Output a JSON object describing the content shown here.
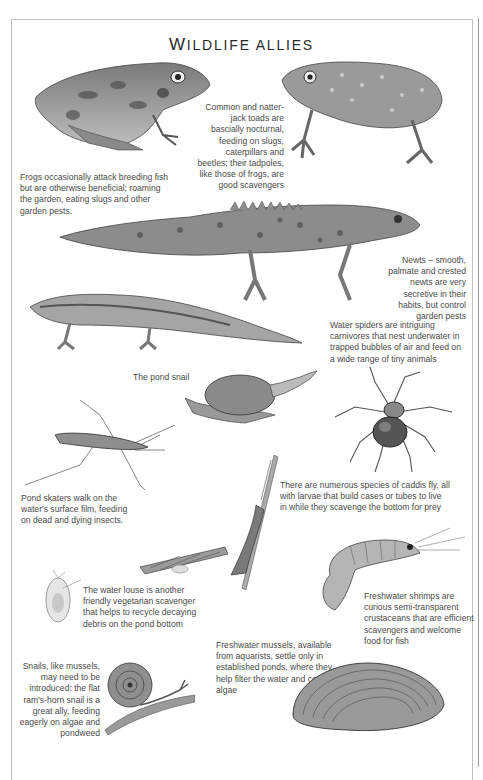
{
  "page": {
    "title_first_letter": "W",
    "title_rest": "ILDLIFE ALLIES"
  },
  "captions": {
    "frogs": "Frogs occasionally attack breeding fish but are otherwise beneficial; roaming the garden, eating slugs and other garden pests.",
    "toads": "Common and natter-jack toads are bascially nocturnal, feeding on slugs, caterpillars and beetles; their tadpoles, like those of frogs, are good scavengers",
    "newts": "Newts – smooth, palmate and crested newts are very secretive in their habits, but control garden pests",
    "water_spiders": "Water spiders are intriguing carnivores that nest underwater in trapped bubbles of air and feed on a wide range of tiny animals",
    "pond_snail": "The pond snail",
    "pond_skaters": "Pond skaters walk on the water's surface film, feeding on dead and dying insects.",
    "caddis_fly": "There are numerous species of caddis fly, all with larvae that build cases or tubes to live in while they scavenge the bottom for prey",
    "water_louse": "The water louse is another friendly vegetarian scavenger that helps to recycle decaying debris on the pond bottom",
    "shrimps": "Freshwater shrimps are curious semi-transparent crustaceans that are efficient scavengers and welcome food for fish",
    "mussels": "Freshwater mussels, available from aquarists, settle only in established ponds, where they help filter the water and control algae",
    "snails": "Snails, like mussels, may need to be introduced: the flat ram's-horn snail is a great ally, feeding eagerly on algae and pondweed"
  },
  "illustrations": [
    {
      "name": "frog-illustration"
    },
    {
      "name": "toad-illustration"
    },
    {
      "name": "crested-newt-illustration"
    },
    {
      "name": "smooth-newt-illustration"
    },
    {
      "name": "pond-snail-illustration"
    },
    {
      "name": "water-spider-illustration"
    },
    {
      "name": "pond-skater-illustration"
    },
    {
      "name": "caddis-fly-illustration"
    },
    {
      "name": "caddis-larva-case-illustration"
    },
    {
      "name": "water-louse-illustration"
    },
    {
      "name": "freshwater-shrimp-illustration"
    },
    {
      "name": "ramshorn-snail-illustration"
    },
    {
      "name": "freshwater-mussel-illustration"
    }
  ]
}
